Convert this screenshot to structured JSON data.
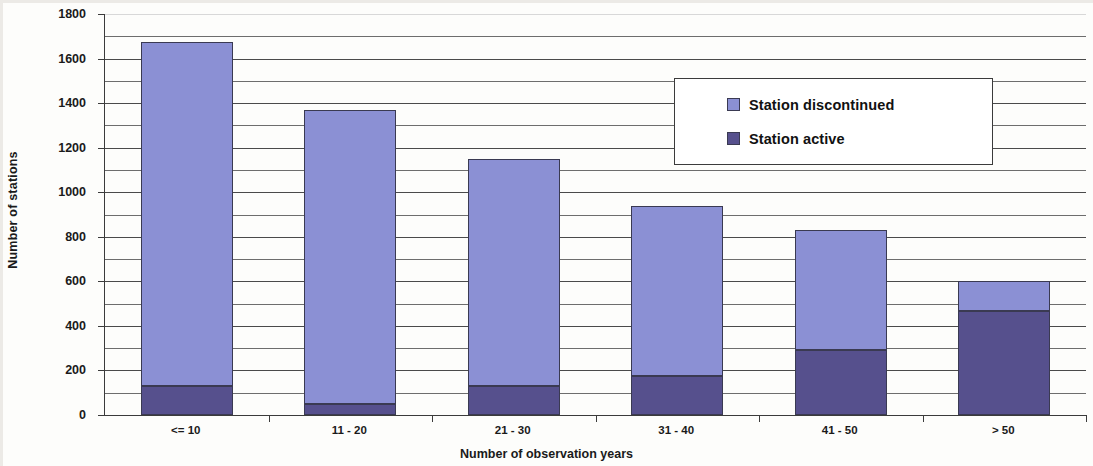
{
  "chart_data": {
    "type": "bar",
    "subtype": "stacked-vertical",
    "title": "",
    "xlabel": "Number of observation years",
    "ylabel": "Number of stations",
    "categories": [
      "<= 10",
      "11 - 20",
      "21 - 30",
      "31 - 40",
      "41 - 50",
      "> 50"
    ],
    "series": [
      {
        "name": "Station active",
        "color": "#56508d",
        "values": [
          130,
          50,
          130,
          175,
          290,
          465
        ]
      },
      {
        "name": "Station discontinued",
        "color": "#8b90d4",
        "values": [
          1545,
          1320,
          1020,
          765,
          540,
          135
        ]
      }
    ],
    "totals": [
      1675,
      1370,
      1150,
      940,
      830,
      600
    ],
    "ylim": [
      0,
      1800
    ],
    "ytick_labels": [
      "0",
      "200",
      "400",
      "600",
      "800",
      "1000",
      "1200",
      "1400",
      "1600",
      "1800"
    ],
    "ytick_values": [
      0,
      200,
      400,
      600,
      800,
      1000,
      1200,
      1400,
      1600,
      1800
    ],
    "minor_gridline_values": [
      100,
      300,
      500,
      700,
      900,
      1100,
      1300,
      1500,
      1700
    ],
    "grid": "horizontal",
    "legend_position": "upper-right-inside",
    "legend_entries": [
      "Station discontinued",
      "Station active"
    ],
    "stack_order": [
      "Station active",
      "Station discontinued"
    ]
  },
  "colors": {
    "discontinued": "#8b90d4",
    "active": "#56508d",
    "bar_outline": "#3a3a52",
    "axis": "#3b3b3b",
    "gridline": "#4a4a4a",
    "background": "#fdfdfb",
    "text": "#1a1a1a"
  }
}
